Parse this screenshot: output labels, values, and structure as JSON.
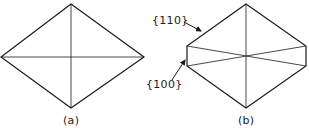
{
  "figure": {
    "panel_a": {
      "label": "(a)",
      "shape": "rhombus with both diagonals"
    },
    "panel_b": {
      "label": "(b)",
      "shape": "truncated rhombus (hexagon) with crossing diagonals"
    },
    "annotations": {
      "face_110": "{110}",
      "face_100": "{100}"
    },
    "colors": {
      "line": "#1a1a1a",
      "background": "#ffffff"
    }
  }
}
